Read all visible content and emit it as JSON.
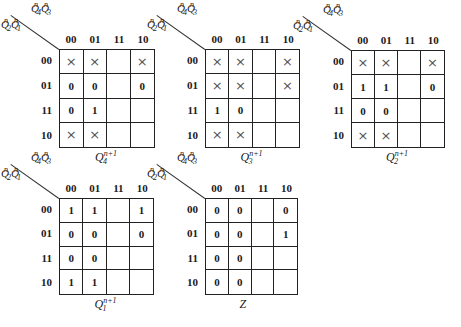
{
  "col_headers": [
    "00",
    "01",
    "11",
    "10"
  ],
  "row_headers": [
    "00",
    "01",
    "11",
    "10"
  ],
  "top_var_label": {
    "a": "Q",
    "a_sub": "4",
    "a_sup": "n",
    "b": "Q",
    "b_sub": "3",
    "b_sup": "n"
  },
  "left_var_label": {
    "a": "Q",
    "a_sub": "2",
    "a_sup": "n",
    "b": "Q",
    "b_sub": "1",
    "b_sup": "n"
  },
  "maps": [
    {
      "id": "q4",
      "title": {
        "base": "Q",
        "sub": "4",
        "sup": "n+1"
      },
      "cells": [
        [
          "×",
          "×",
          "",
          "×"
        ],
        [
          "0",
          "0",
          "",
          "0"
        ],
        [
          "0",
          "1",
          "",
          ""
        ],
        [
          "×",
          "×",
          "",
          ""
        ]
      ]
    },
    {
      "id": "q3",
      "title": {
        "base": "Q",
        "sub": "3",
        "sup": "n+1"
      },
      "cells": [
        [
          "×",
          "×",
          "",
          "×"
        ],
        [
          "×",
          "×",
          "",
          "×"
        ],
        [
          "1",
          "0",
          "",
          ""
        ],
        [
          "×",
          "×",
          "",
          ""
        ]
      ]
    },
    {
      "id": "q2",
      "title": {
        "base": "Q",
        "sub": "2",
        "sup": "n+1"
      },
      "cells": [
        [
          "×",
          "×",
          "",
          "×"
        ],
        [
          "1",
          "1",
          "",
          "0"
        ],
        [
          "0",
          "0",
          "",
          ""
        ],
        [
          "×",
          "×",
          "",
          ""
        ]
      ]
    },
    {
      "id": "q1",
      "title": {
        "base": "Q",
        "sub": "1",
        "sup": "n+1"
      },
      "cells": [
        [
          "1",
          "1",
          "",
          "1"
        ],
        [
          "0",
          "0",
          "",
          "0"
        ],
        [
          "0",
          "0",
          "",
          ""
        ],
        [
          "1",
          "1",
          "",
          ""
        ]
      ]
    },
    {
      "id": "z",
      "title": {
        "base": "Z",
        "sub": "",
        "sup": ""
      },
      "cells": [
        [
          "0",
          "0",
          "",
          "0"
        ],
        [
          "0",
          "0",
          "",
          "1"
        ],
        [
          "0",
          "0",
          "",
          ""
        ],
        [
          "0",
          "0",
          "",
          ""
        ]
      ]
    }
  ]
}
